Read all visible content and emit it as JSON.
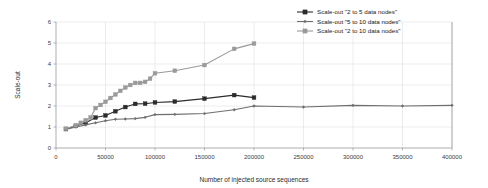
{
  "chart_data": {
    "type": "line",
    "title": "",
    "xlabel": "Number of injected source sequences",
    "ylabel": "Scale-out",
    "xlim": [
      0,
      400000
    ],
    "ylim": [
      0,
      6
    ],
    "xticks": [
      0,
      50000,
      100000,
      150000,
      200000,
      250000,
      300000,
      350000,
      400000
    ],
    "xtick_labels": [
      "0",
      "50000",
      "100000",
      "150000",
      "200000",
      "250000",
      "300000",
      "350000",
      "400000"
    ],
    "yticks": [
      0,
      1,
      2,
      3,
      4,
      5,
      6
    ],
    "ytick_labels": [
      "0",
      "1",
      "2",
      "3",
      "4",
      "5",
      "6"
    ],
    "grid": true,
    "legend_position": "top-right",
    "series": [
      {
        "name": "Scale-out \"2 to 5 data nodes\"",
        "color": "#2b2b2b",
        "marker": "square",
        "x": [
          10000,
          20000,
          30000,
          40000,
          50000,
          60000,
          70000,
          80000,
          90000,
          100000,
          120000,
          150000,
          180000,
          200000
        ],
        "values": [
          0.9,
          1.05,
          1.2,
          1.45,
          1.55,
          1.75,
          1.95,
          2.1,
          2.11,
          2.17,
          2.21,
          2.35,
          2.52,
          2.4
        ]
      },
      {
        "name": "Scale-out \"5 to 10 data nodes\"",
        "color": "#6e6e6e",
        "marker": "diamond",
        "x": [
          10000,
          20000,
          30000,
          40000,
          50000,
          60000,
          70000,
          80000,
          90000,
          100000,
          120000,
          150000,
          180000,
          200000,
          250000,
          300000,
          350000,
          400000
        ],
        "values": [
          0.88,
          1.0,
          1.1,
          1.2,
          1.3,
          1.37,
          1.38,
          1.4,
          1.46,
          1.59,
          1.6,
          1.64,
          1.82,
          2.0,
          1.95,
          2.03,
          2.0,
          2.03
        ]
      },
      {
        "name": "Scale-out \"2 to 10 data nodes\"",
        "color": "#9a9a9a",
        "marker": "square",
        "x": [
          10000,
          20000,
          25000,
          30000,
          35000,
          40000,
          45000,
          50000,
          55000,
          60000,
          65000,
          70000,
          75000,
          80000,
          85000,
          90000,
          95000,
          100000,
          120000,
          150000,
          180000,
          200000
        ],
        "values": [
          0.92,
          1.08,
          1.2,
          1.32,
          1.45,
          1.9,
          2.05,
          2.2,
          2.38,
          2.55,
          2.72,
          2.88,
          3.0,
          3.1,
          3.1,
          3.15,
          3.3,
          3.56,
          3.68,
          3.95,
          4.72,
          4.97
        ]
      }
    ]
  }
}
